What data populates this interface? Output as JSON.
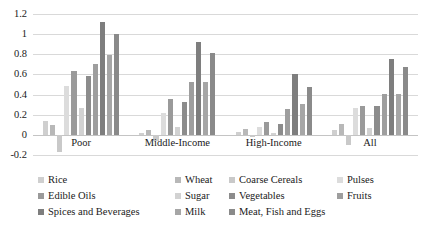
{
  "chart_data": {
    "type": "bar",
    "title": "",
    "subtitle": "",
    "xlabel": "",
    "ylabel": "",
    "ylim": [
      -0.2,
      1.2
    ],
    "ytick_step": 0.2,
    "yticks": [
      "1.2",
      "1",
      "0.8",
      "0.6",
      "0.4",
      "0.2",
      "0",
      "-0.2"
    ],
    "ytick_values": [
      1.2,
      1.0,
      0.8,
      0.6,
      0.4,
      0.2,
      0.0,
      -0.2
    ],
    "grid": true,
    "legend_position": "bottom",
    "orientation": "vertical",
    "grouped": true,
    "categories": [
      "Poor",
      "Middle-Income",
      "High-Income",
      "All"
    ],
    "series": [
      {
        "name": "Rice",
        "color": "#cfcfcf",
        "values": [
          0.14,
          0.02,
          0.03,
          0.05
        ]
      },
      {
        "name": "Wheat",
        "color": "#b8b8b8",
        "values": [
          0.1,
          0.05,
          0.06,
          0.11
        ]
      },
      {
        "name": "Coarse Cereals",
        "color": "#c9c9c9",
        "values": [
          -0.17,
          -0.06,
          -0.02,
          -0.1
        ]
      },
      {
        "name": "Pulses",
        "color": "#dcdcdc",
        "values": [
          0.49,
          0.22,
          0.08,
          0.27
        ]
      },
      {
        "name": "Edible Oils",
        "color": "#9a9a9a",
        "values": [
          0.63,
          0.36,
          0.13,
          0.29
        ]
      },
      {
        "name": "Sugar",
        "color": "#d2d2d2",
        "values": [
          0.27,
          0.08,
          0.02,
          0.07
        ]
      },
      {
        "name": "Vegetables",
        "color": "#8c8c8c",
        "values": [
          0.58,
          0.33,
          0.11,
          0.29
        ]
      },
      {
        "name": "Fruits",
        "color": "#9e9e9e",
        "values": [
          0.7,
          0.52,
          0.26,
          0.41
        ]
      },
      {
        "name": "Spices and Beverages",
        "color": "#7e7e7e",
        "values": [
          1.12,
          0.92,
          0.6,
          0.75
        ]
      },
      {
        "name": "Milk",
        "color": "#a6a6a6",
        "values": [
          0.79,
          0.52,
          0.31,
          0.41
        ]
      },
      {
        "name": "Meat, Fish and Eggs",
        "color": "#8a8a8a",
        "values": [
          1.0,
          0.81,
          0.48,
          0.67
        ]
      }
    ]
  },
  "legend": {
    "rows": [
      [
        {
          "label": "Rice",
          "color": "#cfcfcf",
          "left": 38
        },
        {
          "label": "Wheat",
          "color": "#b8b8b8",
          "left": 175
        },
        {
          "label": "Coarse Cereals",
          "color": "#c9c9c9",
          "left": 229
        },
        {
          "label": "Pulses",
          "color": "#dcdcdc",
          "left": 337
        }
      ],
      [
        {
          "label": "Edible Oils",
          "color": "#9a9a9a",
          "left": 38
        },
        {
          "label": "Sugar",
          "color": "#d2d2d2",
          "left": 175
        },
        {
          "label": "Vegetables",
          "color": "#8c8c8c",
          "left": 229
        },
        {
          "label": "Fruits",
          "color": "#9e9e9e",
          "left": 337
        }
      ],
      [
        {
          "label": "Spices and Beverages",
          "color": "#7e7e7e",
          "left": 38
        },
        {
          "label": "Milk",
          "color": "#a6a6a6",
          "left": 175
        },
        {
          "label": "Meat, Fish and Eggs",
          "color": "#8a8a8a",
          "left": 229
        }
      ]
    ]
  },
  "style": {
    "background": "#ffffff",
    "gridline_color": "#d9d9d9",
    "zeroline_color": "#c4c4c4",
    "text_color": "#1a1a1a"
  }
}
